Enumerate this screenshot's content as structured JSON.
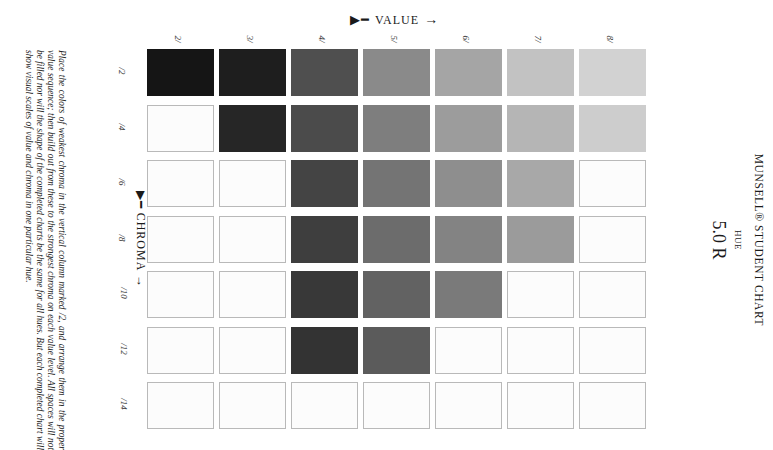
{
  "title": "MUNSELL® STUDENT CHART",
  "hue_label": "HUE",
  "hue_value": "5.0 R",
  "value_axis": {
    "label": "VALUE",
    "feather": "▶━",
    "arrow": "→"
  },
  "chroma_axis": {
    "label": "CHROMA",
    "feather": "▶━",
    "arrow": "→"
  },
  "value_labels": [
    "2/",
    "3/",
    "4/",
    "5/",
    "6/",
    "7/",
    "8/"
  ],
  "chroma_labels": [
    "/2",
    "/4",
    "/6",
    "/8",
    "/10",
    "/12",
    "/14"
  ],
  "instructions": "Place the colors of weakest chroma in the vertical column marked /2, and arrange them in the proper value sequence; then build out from these to the strongest chroma on each value level. All spaces will not be filled nor will the shape of the completed charts be the same for all hues. But each completed chart will show visual scales of value and chroma in one particular hue.",
  "grid": {
    "rows": [
      {
        "chroma": "/2",
        "cells": [
          "#151515",
          "#1e1e1e",
          "#4f4f4f",
          "#8a8a8a",
          "#a5a5a5",
          "#c2c2c2",
          "#d2d2d2"
        ]
      },
      {
        "chroma": "/4",
        "cells": [
          null,
          "#262626",
          "#4b4b4b",
          "#7e7e7e",
          "#9c9c9c",
          "#b5b5b5",
          "#cdcdcd"
        ]
      },
      {
        "chroma": "/6",
        "cells": [
          null,
          null,
          "#444444",
          "#747474",
          "#8e8e8e",
          "#a8a8a8",
          null
        ]
      },
      {
        "chroma": "/8",
        "cells": [
          null,
          null,
          "#3e3e3e",
          "#6c6c6c",
          "#838383",
          "#9b9b9b",
          null
        ]
      },
      {
        "chroma": "/10",
        "cells": [
          null,
          null,
          "#383838",
          "#626262",
          "#7a7a7a",
          null,
          null
        ]
      },
      {
        "chroma": "/12",
        "cells": [
          null,
          null,
          "#333333",
          "#5b5b5b",
          null,
          null,
          null
        ]
      },
      {
        "chroma": "/14",
        "cells": [
          null,
          null,
          null,
          null,
          null,
          null,
          null
        ]
      }
    ]
  }
}
